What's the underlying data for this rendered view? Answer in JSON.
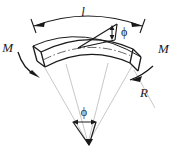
{
  "figure": {
    "title": "Curved beam in pure bending",
    "background_color": "#ffffff",
    "ink_color": "#1a1a1a",
    "construction_line_color": "#b9b9b9",
    "labels": {
      "arc_length": "l",
      "moment_left": "M",
      "moment_right": "M",
      "radius": "R",
      "angle_top": "ϕ",
      "angle_bottom": "ϕ"
    },
    "elements": [
      {
        "name": "arc-length-dimension",
        "label": "l",
        "description": "Curved double-headed dimension arrow spanning the top of the beam"
      },
      {
        "name": "beam-body",
        "description": "Curved beam segment with upper and lower arc faces and straight end faces"
      },
      {
        "name": "neutral-axis",
        "description": "Dash-dot centerline arc through the beam"
      },
      {
        "name": "moment-left",
        "label": "M",
        "description": "Curved moment arrow at the left end face"
      },
      {
        "name": "moment-right",
        "label": "M",
        "description": "Curved moment arrow at the right end face"
      },
      {
        "name": "radius-line",
        "label": "R",
        "description": "Radius line from the center of curvature to the right end of the beam"
      },
      {
        "name": "angle-top",
        "label": "ϕ",
        "description": "Small angle wedge with vertical double arrow at the top right of the beam"
      },
      {
        "name": "angle-bottom",
        "label": "ϕ",
        "description": "Subtended angle wedge at the center of curvature"
      },
      {
        "name": "center-of-curvature",
        "description": "Apex point where radius lines converge"
      }
    ]
  }
}
